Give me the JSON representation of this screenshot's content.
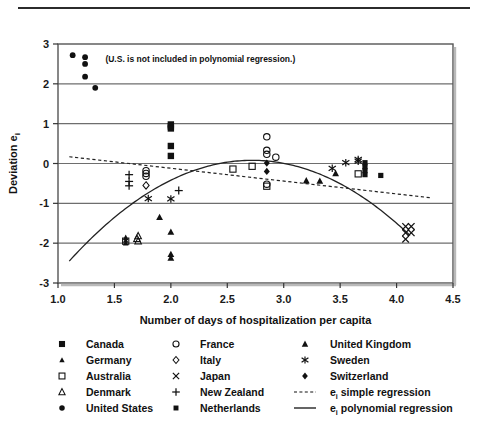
{
  "chart_data": {
    "type": "scatter",
    "title": "",
    "xlabel": "Number of days of hospitalization per capita",
    "ylabel": "Deviation e",
    "ylabel_sub": "i",
    "xlim": [
      1.0,
      4.5
    ],
    "ylim": [
      -3,
      3
    ],
    "xticks": [
      "1.0",
      "1.5",
      "2.0",
      "2.5",
      "3.0",
      "3.5",
      "4.0",
      "4.5"
    ],
    "xtick_values": [
      1.0,
      1.5,
      2.0,
      2.5,
      3.0,
      3.5,
      4.0,
      4.5
    ],
    "yticks": [
      "3",
      "2",
      "1",
      "0",
      "-1",
      "-2",
      "-3"
    ],
    "ytick_values": [
      3,
      2,
      1,
      0,
      -1,
      -2,
      -3
    ],
    "grid": "horizontal",
    "legend_position": "below-plot",
    "annotation": "(U.S. is not included in polynomial regression.)",
    "annotation_xy": [
      1.42,
      2.56
    ],
    "series": [
      {
        "name": "Canada",
        "marker": "filled-square",
        "points": [
          [
            2.0,
            0.98
          ],
          [
            2.0,
            0.93
          ],
          [
            2.0,
            0.88
          ],
          [
            2.0,
            0.44
          ],
          [
            2.0,
            0.19
          ]
        ]
      },
      {
        "name": "Germany",
        "marker": "filled-triangle-small",
        "points": [
          [
            1.6,
            -1.86
          ],
          [
            1.6,
            -1.93
          ],
          [
            1.6,
            -2.0
          ]
        ]
      },
      {
        "name": "Australia",
        "marker": "open-square",
        "points": [
          [
            2.55,
            -0.14
          ],
          [
            2.72,
            -0.07
          ],
          [
            2.85,
            -0.57
          ],
          [
            3.66,
            -0.26
          ],
          [
            1.6,
            -1.95
          ]
        ]
      },
      {
        "name": "Denmark",
        "marker": "open-triangle",
        "points": [
          [
            1.71,
            -1.82
          ],
          [
            1.71,
            -1.95
          ],
          [
            1.7,
            -1.89
          ]
        ]
      },
      {
        "name": "United States",
        "marker": "filled-circle",
        "points": [
          [
            1.13,
            2.72
          ],
          [
            1.24,
            2.67
          ],
          [
            1.24,
            2.5
          ],
          [
            1.24,
            2.18
          ],
          [
            1.33,
            1.9
          ]
        ]
      },
      {
        "name": "France",
        "marker": "open-circle",
        "points": [
          [
            1.78,
            -0.18
          ],
          [
            1.78,
            -0.25
          ],
          [
            1.78,
            -0.32
          ],
          [
            2.85,
            0.67
          ],
          [
            2.85,
            0.33
          ],
          [
            2.85,
            0.23
          ],
          [
            2.93,
            0.16
          ],
          [
            2.85,
            -0.52
          ]
        ]
      },
      {
        "name": "Italy",
        "marker": "open-diamond",
        "points": [
          [
            1.78,
            -0.55
          ]
        ]
      },
      {
        "name": "Japan",
        "marker": "x-cross",
        "points": [
          [
            4.08,
            -1.58
          ],
          [
            4.13,
            -1.58
          ],
          [
            4.08,
            -1.74
          ],
          [
            4.13,
            -1.74
          ],
          [
            4.08,
            -1.9
          ]
        ]
      },
      {
        "name": "New Zealand",
        "marker": "plus",
        "points": [
          [
            1.63,
            -0.28
          ],
          [
            1.63,
            -0.45
          ],
          [
            1.63,
            -0.56
          ],
          [
            2.07,
            -0.68
          ]
        ]
      },
      {
        "name": "Netherlands",
        "marker": "filled-square-small",
        "points": [
          [
            3.72,
            0.02
          ],
          [
            3.72,
            -0.08
          ],
          [
            3.72,
            -0.18
          ],
          [
            3.72,
            -0.28
          ],
          [
            3.86,
            -0.3
          ]
        ]
      },
      {
        "name": "United Kingdom",
        "marker": "filled-triangle",
        "points": [
          [
            1.9,
            -1.35
          ],
          [
            2.0,
            -1.72
          ],
          [
            2.0,
            -2.28
          ],
          [
            2.0,
            -2.37
          ],
          [
            3.2,
            -0.43
          ],
          [
            3.32,
            -0.44
          ],
          [
            3.46,
            -0.25
          ]
        ]
      },
      {
        "name": "Sweden",
        "marker": "star-asterisk",
        "points": [
          [
            1.8,
            -0.88
          ],
          [
            2.0,
            -0.89
          ],
          [
            3.43,
            -0.12
          ],
          [
            3.55,
            0.02
          ],
          [
            3.66,
            0.06
          ],
          [
            3.66,
            0.1
          ]
        ]
      },
      {
        "name": "Switzerland",
        "marker": "filled-diamond",
        "points": [
          [
            2.85,
            0.01
          ],
          [
            2.85,
            -0.2
          ]
        ]
      }
    ],
    "regression_lines": [
      {
        "name": "e_i simple regression",
        "style": "dashed",
        "label": "e",
        "label_sub": "i",
        "label_rest": " simple regression",
        "endpoints": [
          [
            1.1,
            0.17
          ],
          [
            4.3,
            -0.86
          ]
        ]
      },
      {
        "name": "e_i polynomial regression",
        "style": "solid",
        "label": "e",
        "label_sub": "i",
        "label_rest": " polynomial regression",
        "vertex": [
          2.72,
          0.08
        ],
        "endpoints": [
          [
            1.1,
            -2.45
          ],
          [
            4.12,
            -1.6
          ]
        ]
      }
    ]
  },
  "legend": {
    "columns": [
      [
        {
          "marker": "filled-square",
          "label": "Canada"
        },
        {
          "marker": "filled-triangle-small",
          "label": "Germany"
        },
        {
          "marker": "open-square",
          "label": "Australia"
        },
        {
          "marker": "open-triangle",
          "label": "Denmark"
        },
        {
          "marker": "filled-circle",
          "label": "United States"
        }
      ],
      [
        {
          "marker": "open-circle",
          "label": "France"
        },
        {
          "marker": "open-diamond",
          "label": "Italy"
        },
        {
          "marker": "x-cross",
          "label": "Japan"
        },
        {
          "marker": "plus",
          "label": "New Zealand"
        },
        {
          "marker": "filled-square-small",
          "label": "Netherlands"
        }
      ],
      [
        {
          "marker": "filled-triangle",
          "label": "United Kingdom"
        },
        {
          "marker": "star-asterisk",
          "label": "Sweden"
        },
        {
          "marker": "filled-diamond",
          "label": "Switzerland"
        },
        {
          "marker": "dashed-line",
          "label": "e",
          "label_sub": "i",
          "label_rest": " simple regression"
        },
        {
          "marker": "solid-line",
          "label": "e",
          "label_sub": "i",
          "label_rest": " polynomial regression"
        }
      ]
    ]
  },
  "colors": {
    "ink": "#1a1a1a",
    "grid": "#6e6e6e",
    "frame": "#555555",
    "rule": "#2b2b2b",
    "background": "#ffffff"
  }
}
